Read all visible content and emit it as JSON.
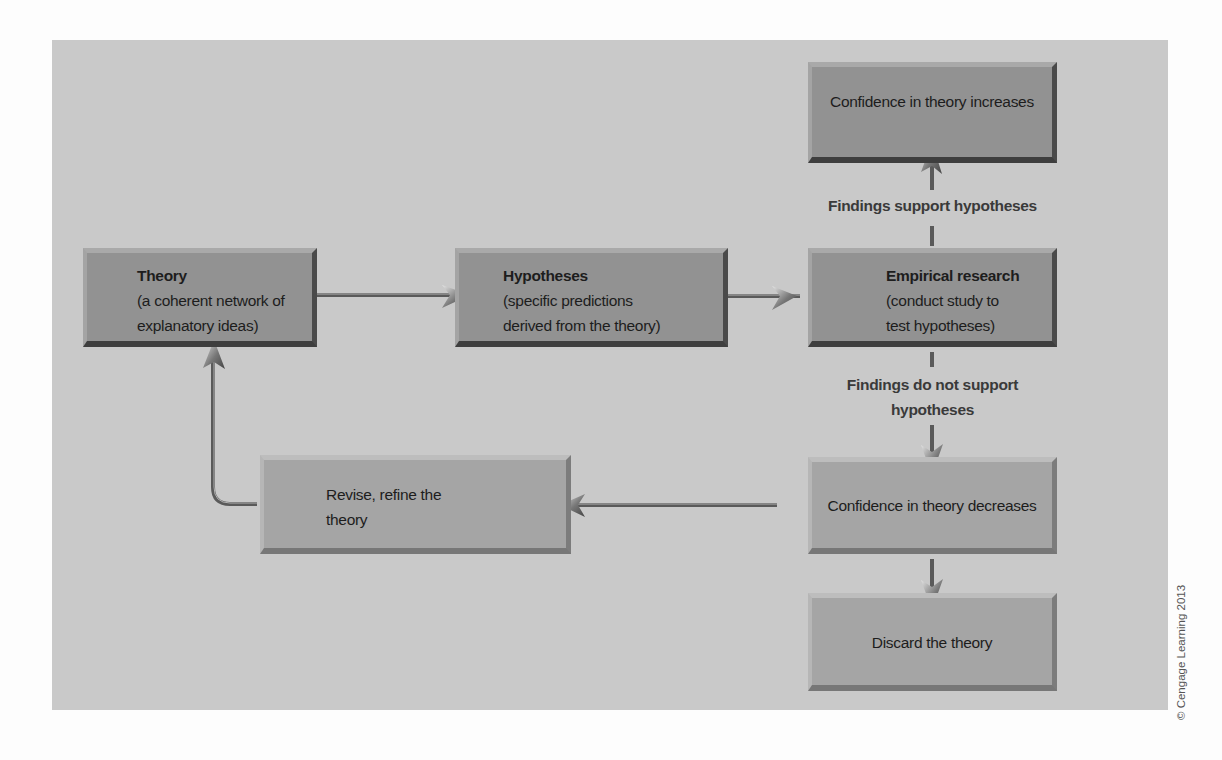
{
  "diagram": {
    "boxes": {
      "theory": {
        "title": "Theory",
        "line1": "(a coherent network of",
        "line2": "explanatory ideas)"
      },
      "hypotheses": {
        "title": "Hypotheses",
        "line1": "(specific predictions",
        "line2": "derived from the theory)"
      },
      "empirical": {
        "title": "Empirical research",
        "line1": "(conduct study to",
        "line2": "test hypotheses)"
      },
      "confidence_increases": {
        "text": "Confidence in theory increases"
      },
      "confidence_decreases": {
        "text": "Confidence in theory decreases"
      },
      "revise": {
        "line1": "Revise, refine the",
        "line2": "theory"
      },
      "discard": {
        "text": "Discard the theory"
      }
    },
    "labels": {
      "support": "Findings support hypotheses",
      "not_support_line1": "Findings do not support",
      "not_support_line2": "hypotheses"
    },
    "colors": {
      "panel": "#c9c9c9",
      "dark_box": "#929292",
      "light_box": "#a5a5a5",
      "arrow": "#555555"
    }
  },
  "copyright": "© Cengage Learning 2013"
}
